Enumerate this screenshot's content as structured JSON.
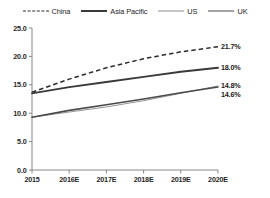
{
  "chart_data": {
    "type": "line",
    "title": "",
    "xlabel": "",
    "ylabel": "",
    "categories": [
      "2015",
      "2016E",
      "2017E",
      "2018E",
      "2019E",
      "2020E"
    ],
    "ylim": [
      0.0,
      25.0
    ],
    "yticks": [
      "0.0",
      "5.0",
      "10.0",
      "15.0",
      "20.0",
      "25.0"
    ],
    "ytick_values": [
      0.0,
      5.0,
      10.0,
      15.0,
      20.0,
      25.0
    ],
    "grid": false,
    "legend_position": "top",
    "series": [
      {
        "name": "China",
        "style": "dashed",
        "values": [
          13.7,
          16.0,
          18.0,
          19.6,
          20.8,
          21.7
        ],
        "end_label": "21.7%"
      },
      {
        "name": "Asia Pacific",
        "style": "solid-thick",
        "values": [
          13.5,
          14.6,
          15.5,
          16.4,
          17.3,
          18.0
        ],
        "end_label": "18.0%"
      },
      {
        "name": "US",
        "style": "solid-thin",
        "values": [
          9.3,
          10.2,
          11.1,
          12.2,
          13.5,
          14.8
        ],
        "end_label": "14.8%"
      },
      {
        "name": "UK",
        "style": "solid-medium",
        "values": [
          9.3,
          10.5,
          11.5,
          12.5,
          13.6,
          14.6
        ],
        "end_label": "14.6%"
      }
    ],
    "end_labels": [
      "21.7%",
      "18.0%",
      "14.8%",
      "14.6%"
    ]
  },
  "legend": {
    "items": [
      {
        "label": "China"
      },
      {
        "label": "Asia Pacific"
      },
      {
        "label": "US"
      },
      {
        "label": "UK"
      }
    ]
  },
  "caption": {
    "text": ""
  }
}
